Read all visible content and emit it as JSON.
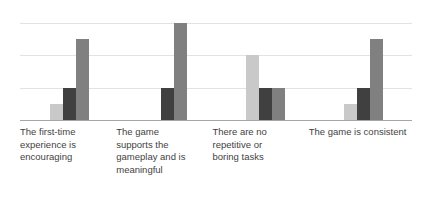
{
  "chart_data": {
    "type": "bar",
    "title": "",
    "subtitle": "",
    "xlabel": "",
    "ylabel": "",
    "ylim": [
      0,
      6
    ],
    "yticks": [
      "0",
      "2",
      "4",
      "6"
    ],
    "ytick_values": [
      0,
      2,
      4,
      6
    ],
    "grid": true,
    "legend": "none",
    "categories": [
      "The first-time experience is encouraging",
      "The game supports the gameplay and is meaningful",
      "There are no repetitive or boring tasks",
      "The game is consistent"
    ],
    "category_labels_wrapped": [
      "The first-time\nexperience is\nencouraging",
      "The game\nsupports the\ngameplay and is\nmeaningful",
      "There are no\nrepetitive or\nboring tasks",
      "The game is consistent"
    ],
    "series": [
      {
        "name": "Series 1",
        "color": "#c9c9c9",
        "values": [
          1,
          0,
          4,
          1
        ]
      },
      {
        "name": "Series 2",
        "color": "#404040",
        "values": [
          2,
          2,
          2,
          2
        ]
      },
      {
        "name": "Series 3",
        "color": "#808080",
        "values": [
          5,
          6,
          2,
          5
        ]
      }
    ],
    "colors": {
      "series_1": "#c9c9c9",
      "series_2": "#404040",
      "series_3": "#808080",
      "gridline": "#e2e2e2",
      "axis": "#a6a6a6",
      "tick_text": "#7f7f7f",
      "label_text": "#3f3f3f",
      "background": "#ffffff"
    }
  }
}
